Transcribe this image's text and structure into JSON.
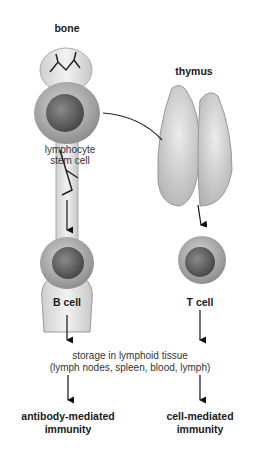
{
  "labels": {
    "bone": "bone",
    "thymus": "thymus",
    "stem_cell_line1": "lymphocyte",
    "stem_cell_line2": "stem cell",
    "b_cell": "B cell",
    "t_cell": "T cell",
    "storage_line1": "storage in lymphoid tissue",
    "storage_line2": "(lymph nodes, spleen, blood, lymph)",
    "left_outcome_line1": "antibody-mediated",
    "left_outcome_line2": "immunity",
    "right_outcome_line1": "cell-mediated",
    "right_outcome_line2": "immunity"
  },
  "colors": {
    "cell_body": "#b5b5b5",
    "nucleus": "#6e6e6e",
    "bone": "#e6e6e6",
    "thymus": "#cfcfcf",
    "text": "#1a1a1a"
  }
}
